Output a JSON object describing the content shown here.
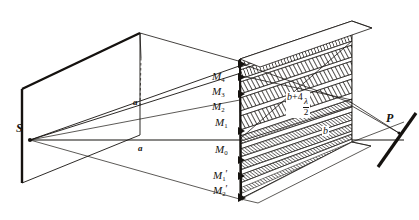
{
  "figure": {
    "background_color": "#ffffff",
    "ink_color": "#15120f"
  },
  "labels": {
    "source": "S",
    "screen_point": "P",
    "distance_a_upper": "a",
    "distance_a_lower": "a",
    "zone_boundaries": [
      {
        "id": "m4",
        "text": "M",
        "sub": "4",
        "prime": ""
      },
      {
        "id": "m3",
        "text": "M",
        "sub": "3",
        "prime": ""
      },
      {
        "id": "m2",
        "text": "M",
        "sub": "2",
        "prime": ""
      },
      {
        "id": "m1",
        "text": "M",
        "sub": "1",
        "prime": ""
      },
      {
        "id": "m0",
        "text": "M",
        "sub": "0",
        "prime": ""
      },
      {
        "id": "m1p",
        "text": "M",
        "sub": "1",
        "prime": "′"
      },
      {
        "id": "m2p",
        "text": "M",
        "sub": "2",
        "prime": "′"
      }
    ],
    "path_length_upper": {
      "lead": "b",
      "plus": "+",
      "factor": "4",
      "numerator": "λ",
      "denominator": "2"
    },
    "path_length_lower": "b"
  }
}
